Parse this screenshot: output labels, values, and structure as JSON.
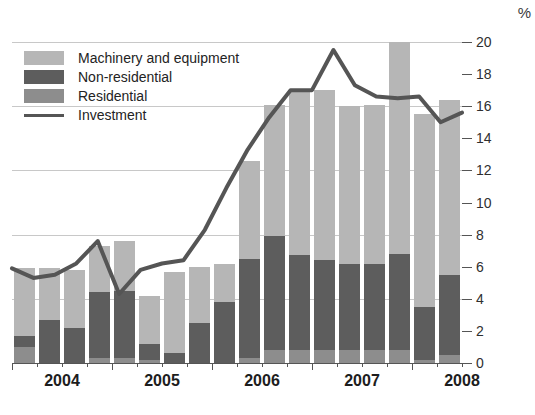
{
  "title": "",
  "axis": {
    "unit_symbol": "%",
    "y_ticks": [
      0,
      2,
      4,
      6,
      8,
      10,
      12,
      14,
      16,
      18,
      20
    ],
    "y_gridlines": [
      0,
      4,
      8,
      12,
      16,
      20
    ],
    "y_min": 0,
    "y_max": 20,
    "x_labels": [
      "2004",
      "2005",
      "2006",
      "2007",
      "2008"
    ]
  },
  "legend": {
    "items": [
      {
        "label": "Machinery and equipment",
        "swatch": "mach",
        "color": "#b6b6b6"
      },
      {
        "label": "Non-residential",
        "swatch": "non",
        "color": "#5d5d5d"
      },
      {
        "label": "Residential",
        "swatch": "res",
        "color": "#8d8d8d"
      },
      {
        "label": "Investment",
        "swatch": "line",
        "color": "#555555"
      }
    ]
  },
  "chart_data": {
    "type": "bar",
    "title": "",
    "xlabel": "",
    "ylabel": "%",
    "ylim": [
      0,
      20
    ],
    "grid": true,
    "legend_position": "top-left",
    "stacked": true,
    "overlay_line": {
      "name": "Investment",
      "color": "#555555",
      "values": [
        5.9,
        5.3,
        5.5,
        6.2,
        7.6,
        4.3,
        5.8,
        6.2,
        6.4,
        8.3,
        10.9,
        13.3,
        15.3,
        17.0,
        17.0,
        19.5,
        17.3,
        16.6,
        16.5,
        16.6,
        15.0,
        15.6
      ]
    },
    "categories": [
      "2004 Q1",
      "2004 Q2",
      "2004 Q3",
      "2004 Q4",
      "2005 Q1",
      "2005 Q2",
      "2005 Q3",
      "2005 Q4",
      "2006 Q1",
      "2006 Q2",
      "2006 Q3",
      "2006 Q4",
      "2007 Q1",
      "2007 Q2",
      "2007 Q3",
      "2007 Q4",
      "2008 Q1",
      "2008 Q2"
    ],
    "series": [
      {
        "name": "Residential",
        "color": "#8d8d8d",
        "values": [
          1.0,
          0.0,
          0.0,
          0.3,
          0.3,
          0.2,
          0.0,
          0.0,
          0.0,
          0.3,
          0.8,
          0.8,
          0.8,
          0.8,
          0.8,
          0.8,
          0.2,
          0.5
        ]
      },
      {
        "name": "Non-residential",
        "color": "#5d5d5d",
        "values": [
          0.7,
          2.7,
          2.2,
          4.1,
          4.2,
          1.0,
          0.6,
          2.5,
          3.8,
          6.2,
          7.1,
          5.9,
          5.6,
          5.4,
          5.4,
          6.0,
          3.3,
          5.0
        ]
      },
      {
        "name": "Machinery and equipment",
        "color": "#b6b6b6",
        "values": [
          4.2,
          3.2,
          3.6,
          2.9,
          3.1,
          3.0,
          5.1,
          3.5,
          2.4,
          6.1,
          8.2,
          10.3,
          10.6,
          9.8,
          9.9,
          13.2,
          12.0,
          10.9
        ]
      }
    ]
  }
}
